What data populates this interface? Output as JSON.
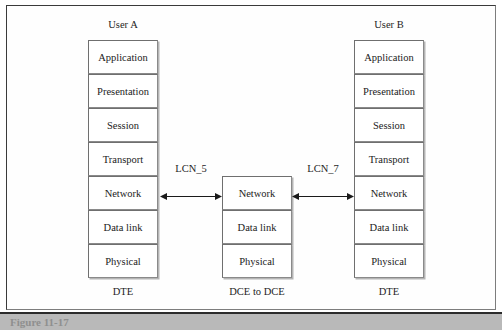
{
  "figure": {
    "caption": "Figure 11-17",
    "left_stack": {
      "title": "User A",
      "footer": "DTE",
      "layers": [
        "Application",
        "Presentation",
        "Session",
        "Transport",
        "Network",
        "Data link",
        "Physical"
      ]
    },
    "middle_stack": {
      "title": "",
      "footer": "DCE to DCE",
      "layers": [
        "Network",
        "Data link",
        "Physical"
      ]
    },
    "right_stack": {
      "title": "User B",
      "footer": "DTE",
      "layers": [
        "Application",
        "Presentation",
        "Session",
        "Transport",
        "Network",
        "Data link",
        "Physical"
      ]
    },
    "links": [
      {
        "label": "LCN_5"
      },
      {
        "label": "LCN_7"
      }
    ],
    "colors": {
      "frame_border": "#3a3a3a",
      "box_border": "#6f6f6f",
      "text": "#1b1b1b",
      "caption_band": "#b9b9b9"
    }
  }
}
